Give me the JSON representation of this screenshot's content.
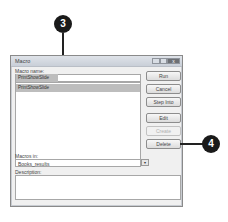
{
  "dialog": {
    "title": "Macro",
    "window_buttons": {
      "minimize": "",
      "maximize": "",
      "close": "x"
    },
    "macro_name_label": "Macro name:",
    "macro_name_value": "PrintShowSlide",
    "macro_list": [
      {
        "label": "PrintShowSlide",
        "selected": true
      }
    ],
    "buttons": {
      "run": "Run",
      "cancel": "Cancel",
      "step_into": "Step Into",
      "edit": "Edit",
      "create": "Create",
      "delete": "Delete"
    },
    "macros_in_label": "Macros in:",
    "macros_in_value": "Books_results",
    "dropdown_arrow": "▾",
    "description_label": "Description:",
    "description_value": ""
  },
  "callouts": {
    "step3": "3",
    "step4": "4"
  }
}
